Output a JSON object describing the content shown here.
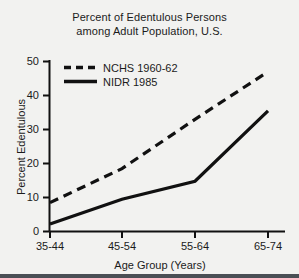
{
  "chart_data": {
    "type": "line",
    "title": "Percent of Edentulous Persons among Adult Population, U.S.",
    "title_line1": "Percent of Edentulous Persons",
    "title_line2": "among Adult Population, U.S.",
    "xlabel": "Age Group (Years)",
    "ylabel": "Percent Edentulous",
    "categories": [
      "35-44",
      "45-54",
      "55-64",
      "65-74"
    ],
    "yticks": [
      "0",
      "10",
      "20",
      "30",
      "40",
      "50"
    ],
    "ylim": [
      0,
      50
    ],
    "grid": false,
    "legend_position": "top-left-inside",
    "series": [
      {
        "name": "NCHS 1960-62",
        "style": "dashed",
        "color": "#111111",
        "values": [
          8.5,
          18.5,
          33,
          47
        ]
      },
      {
        "name": "NIDR 1985",
        "style": "solid",
        "color": "#111111",
        "values": [
          2.2,
          9.5,
          14.8,
          35.5
        ]
      }
    ]
  },
  "legend": {
    "items": [
      {
        "label": "NCHS 1960-62",
        "style": "dashed"
      },
      {
        "label": "NIDR 1985",
        "style": "solid"
      }
    ]
  },
  "colors": {
    "background": "#f2f2f0",
    "ink": "#111111",
    "bottom_border": "#4a4f55"
  }
}
